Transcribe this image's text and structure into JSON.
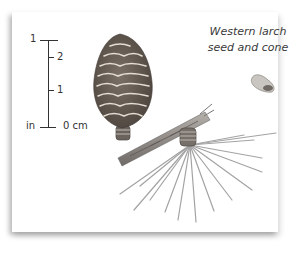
{
  "caption": {
    "line1": "Western larch",
    "line2": "seed and cone"
  },
  "scale": {
    "inch_top_label": "1",
    "cm_labels": [
      "2",
      "1"
    ],
    "inch_unit": "in",
    "cm_zero": "0 cm"
  },
  "illustration": {
    "subjects": [
      "larch-cone",
      "branch",
      "needle-cluster",
      "seed"
    ],
    "colors": {
      "cone": "#6a5f55",
      "cone_highlight": "#e4ddd3",
      "branch": "#8a8580",
      "needles": "#9a9a9a",
      "seed": "#8a8680"
    }
  }
}
